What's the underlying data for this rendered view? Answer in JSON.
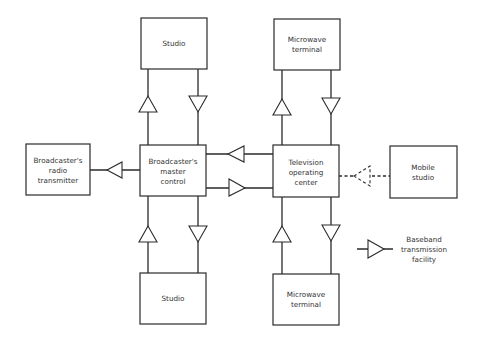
{
  "diagram": {
    "type": "block-diagram",
    "colors": {
      "stroke": "#2a2a2a",
      "text": "#333333",
      "background": "#ffffff"
    },
    "nodes": {
      "studio_top": {
        "lines": [
          "Studio"
        ]
      },
      "microwave_top": {
        "lines": [
          "Microwave",
          "terminal"
        ]
      },
      "radio_transmitter": {
        "lines": [
          "Broadcaster's",
          "radio",
          "transmitter"
        ]
      },
      "master_control": {
        "lines": [
          "Broadcaster's",
          "master",
          "control"
        ]
      },
      "operating_center": {
        "lines": [
          "Television",
          "operating",
          "center"
        ]
      },
      "mobile_studio": {
        "lines": [
          "Mobile",
          "studio"
        ]
      },
      "studio_bottom": {
        "lines": [
          "Studio"
        ]
      },
      "microwave_bottom": {
        "lines": [
          "Microwave",
          "terminal"
        ]
      }
    },
    "legend": {
      "symbol": "baseband-amplifier-triangle",
      "lines": [
        "Baseband",
        "transmission",
        "facility"
      ]
    },
    "edges": [
      {
        "from": "master_control",
        "to": "studio_top",
        "symbol": "triangle-up"
      },
      {
        "from": "studio_top",
        "to": "master_control",
        "symbol": "triangle-down"
      },
      {
        "from": "operating_center",
        "to": "microwave_top",
        "symbol": "triangle-up"
      },
      {
        "from": "microwave_top",
        "to": "operating_center",
        "symbol": "triangle-down"
      },
      {
        "from": "master_control",
        "to": "radio_transmitter",
        "symbol": "triangle-left"
      },
      {
        "from": "operating_center",
        "to": "master_control",
        "symbol": "triangle-left"
      },
      {
        "from": "master_control",
        "to": "operating_center",
        "symbol": "triangle-right"
      },
      {
        "from": "mobile_studio",
        "to": "operating_center",
        "symbol": "triangle-left",
        "style": "dashed"
      },
      {
        "from": "studio_bottom",
        "to": "master_control",
        "symbol": "triangle-up"
      },
      {
        "from": "master_control",
        "to": "studio_bottom",
        "symbol": "triangle-down"
      },
      {
        "from": "microwave_bottom",
        "to": "operating_center",
        "symbol": "triangle-up"
      },
      {
        "from": "operating_center",
        "to": "microwave_bottom",
        "symbol": "triangle-down"
      }
    ]
  }
}
